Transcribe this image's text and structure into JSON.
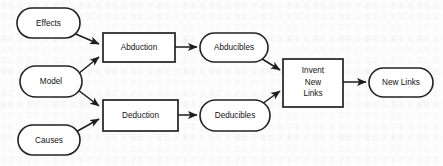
{
  "diagram": {
    "type": "flowchart",
    "nodes": [
      {
        "id": "effects",
        "label": "Effects",
        "shape": "rounded-oval",
        "x": 17,
        "y": 8,
        "w": 63,
        "h": 30
      },
      {
        "id": "model",
        "label": "Model",
        "shape": "rounded-oval",
        "x": 20,
        "y": 66,
        "w": 62,
        "h": 31
      },
      {
        "id": "causes",
        "label": "Causes",
        "shape": "rounded-oval",
        "x": 18,
        "y": 125,
        "w": 62,
        "h": 30
      },
      {
        "id": "abduction",
        "label": "Abduction",
        "shape": "rectangle",
        "x": 103,
        "y": 33,
        "w": 72,
        "h": 29
      },
      {
        "id": "deduction",
        "label": "Deduction",
        "shape": "rectangle",
        "x": 103,
        "y": 100,
        "w": 75,
        "h": 31
      },
      {
        "id": "abducibles",
        "label": "Abducibles",
        "shape": "rounded-oval",
        "x": 200,
        "y": 33,
        "w": 68,
        "h": 29
      },
      {
        "id": "deducibles",
        "label": "Deducibles",
        "shape": "rounded-oval",
        "x": 200,
        "y": 100,
        "w": 70,
        "h": 31
      },
      {
        "id": "invent",
        "label": "Invent New Links",
        "label_lines": [
          "Invent",
          "New",
          "Links"
        ],
        "shape": "rectangle",
        "x": 283,
        "y": 59,
        "w": 60,
        "h": 48
      },
      {
        "id": "newlinks",
        "label": "New Links",
        "shape": "rounded-oval",
        "x": 369,
        "y": 68,
        "w": 64,
        "h": 29
      }
    ],
    "edges": [
      {
        "from": "effects",
        "to": "abduction",
        "style": "arrow"
      },
      {
        "from": "model",
        "to": "abduction",
        "style": "arrow"
      },
      {
        "from": "model",
        "to": "deduction",
        "style": "arrow"
      },
      {
        "from": "causes",
        "to": "deduction",
        "style": "arrow"
      },
      {
        "from": "abduction",
        "to": "abducibles",
        "style": "arrow"
      },
      {
        "from": "deduction",
        "to": "deducibles",
        "style": "arrow"
      },
      {
        "from": "abducibles",
        "to": "invent",
        "style": "arrow"
      },
      {
        "from": "deducibles",
        "to": "invent",
        "style": "arrow"
      },
      {
        "from": "invent",
        "to": "newlinks",
        "style": "arrow"
      }
    ],
    "colors": {
      "stroke": "#222222",
      "fill": "#ffffff",
      "text": "#111111",
      "background": "#fdfdfd"
    }
  },
  "labels": {
    "effects": "Effects",
    "model": "Model",
    "causes": "Causes",
    "abduction": "Abduction",
    "deduction": "Deduction",
    "abducibles": "Abducibles",
    "deducibles": "Deducibles",
    "invent_1": "Invent",
    "invent_2": "New",
    "invent_3": "Links",
    "newlinks": "New Links"
  }
}
